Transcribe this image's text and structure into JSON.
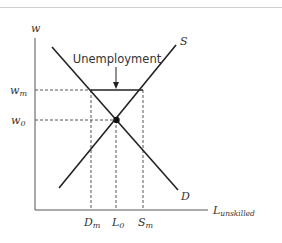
{
  "diagram": {
    "y_axis_label": "w",
    "x_axis_label_main": "L",
    "x_axis_label_sub": "unskilled",
    "curves": {
      "supply_label": "S",
      "demand_label": "D"
    },
    "y_ticks": {
      "wm_main": "w",
      "wm_sub": "m",
      "w0_main": "w",
      "w0_sub": "0"
    },
    "x_ticks": {
      "dm_main": "D",
      "dm_sub": "m",
      "l0_main": "L",
      "l0_sub": "0",
      "sm_main": "S",
      "sm_sub": "m"
    },
    "annotation": "Unemployment",
    "colors": {
      "line": "#222222",
      "dashed": "#555555",
      "axis": "#555555"
    }
  }
}
